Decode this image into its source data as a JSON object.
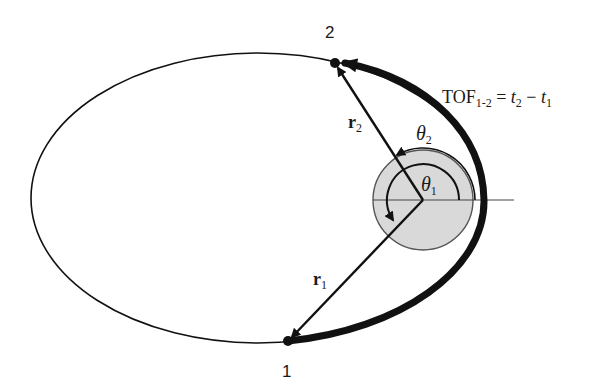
{
  "diagram": {
    "colors": {
      "background": "#ffffff",
      "stroke": "#111111",
      "central_body_fill": "#d9d9d9",
      "central_body_stroke": "#555555"
    },
    "orbit": {
      "shape": "ellipse",
      "cx": 258,
      "cy": 198,
      "rx": 227,
      "ry": 145
    },
    "focus": {
      "x": 423,
      "y": 200
    },
    "central_body": {
      "r": 50
    },
    "points": [
      {
        "id": "1",
        "label": "1",
        "x": 288,
        "y": 341
      },
      {
        "id": "2",
        "label": "2",
        "x": 335,
        "y": 63
      }
    ],
    "vectors": [
      {
        "label_main": "r",
        "label_sub": "1"
      },
      {
        "label_main": "r",
        "label_sub": "2"
      }
    ],
    "angles": [
      {
        "label_main": "θ",
        "label_sub": "1"
      },
      {
        "label_main": "θ",
        "label_sub": "2"
      }
    ],
    "tof_label": {
      "main": "TOF",
      "sub": "1-2",
      "eq": " = ",
      "t2": "t",
      "t2_sub": "2",
      "minus": " − ",
      "t1": "t",
      "t1_sub": "1"
    }
  }
}
